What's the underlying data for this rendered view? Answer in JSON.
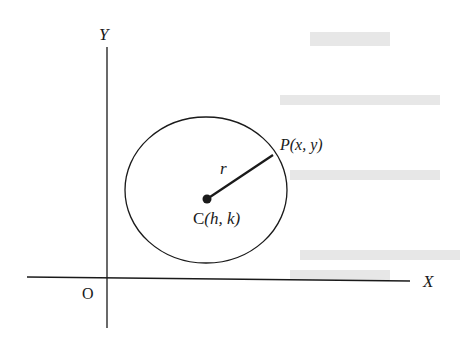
{
  "figure": {
    "type": "coordinate-geometry-circle",
    "axes": {
      "x_label": "X",
      "y_label": "Y",
      "origin_label": "O"
    },
    "circle": {
      "center_label": "C(h, k)",
      "center_prefix": "C",
      "center_coords": "(h, k)",
      "radius_label": "r",
      "point_label": "P(x, y)",
      "point_prefix": "P",
      "point_coords": "(x, y)"
    },
    "colors": {
      "stroke": "#1a1a1a",
      "background": "#ffffff",
      "show_through": "#e6e6e6"
    }
  }
}
